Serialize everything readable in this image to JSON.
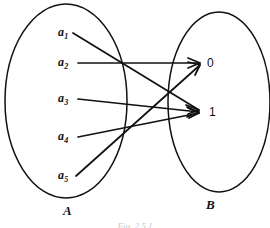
{
  "figure": {
    "caption": "Fig. 2.5.1",
    "domain_set": {
      "name": "A",
      "elements": [
        {
          "id": "a1",
          "label": "a",
          "subscript": "1"
        },
        {
          "id": "a2",
          "label": "a",
          "subscript": "2"
        },
        {
          "id": "a3",
          "label": "a",
          "subscript": "3"
        },
        {
          "id": "a4",
          "label": "a",
          "subscript": "4"
        },
        {
          "id": "a5",
          "label": "a",
          "subscript": "5"
        }
      ]
    },
    "codomain_set": {
      "name": "B",
      "elements": [
        {
          "id": "b0",
          "label": "0"
        },
        {
          "id": "b1",
          "label": "1"
        }
      ]
    },
    "mappings": [
      {
        "from": "a1",
        "to": "b1"
      },
      {
        "from": "a2",
        "to": "b0"
      },
      {
        "from": "a3",
        "to": "b1"
      },
      {
        "from": "a4",
        "to": "b1"
      },
      {
        "from": "a5",
        "to": "b0"
      }
    ],
    "colors": {
      "stroke": "#111111",
      "background": "#ffffff",
      "caption": "#c9c9c9"
    }
  }
}
